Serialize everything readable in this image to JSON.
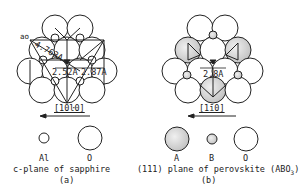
{
  "panel_a": {
    "lattice_constant_label": "ao",
    "lattice_constant_value": "4.763A",
    "distance_1": "2.52A",
    "distance_2": "2.87A",
    "direction": "[10ŀ0]",
    "legend": [
      {
        "symbol": "small-open-circle",
        "label": "Al"
      },
      {
        "symbol": "large-open-circle",
        "label": "O"
      }
    ],
    "caption": "c-plane of sapphire",
    "letter": "(a)"
  },
  "panel_b": {
    "distance": "2.8A",
    "direction": "[1ī0]",
    "legend": [
      {
        "symbol": "large-shaded-circle",
        "label": "A",
        "fill": "#d9d9d9"
      },
      {
        "symbol": "small-shaded-circle",
        "label": "B",
        "fill": "#d9d9d9"
      },
      {
        "symbol": "large-open-circle",
        "label": "O"
      }
    ],
    "caption_prefix": "(111) plane of perovskite (ABO",
    "caption_sub": "3",
    "caption_suffix": ")",
    "letter": "(b)"
  },
  "colors": {
    "line": "#222222",
    "shade": "#d6d6d6"
  }
}
